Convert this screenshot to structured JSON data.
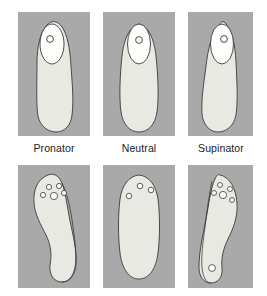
{
  "figure": {
    "panel_bg": "#a9a9a9",
    "shape_fill": "#e9e9e4",
    "shape_stroke": "#3a3a3a",
    "hole_fill": "#ffffff",
    "caption_color": "#1b1b1b"
  },
  "columns": [
    {
      "key": "pronator",
      "caption": "Pronator",
      "top_panel": {
        "name": "rear-view-foot-pronator",
        "description": "Posterior view of foot angled inward (everted heel)",
        "ankle_marker_count": 1
      },
      "bottom_panel": {
        "name": "insole-pronator",
        "description": "Medial-post insole with inner contour line",
        "forefoot_holes": 5,
        "heel_holes": 0,
        "has_inner_contour": true
      }
    },
    {
      "key": "neutral",
      "caption": "Neutral",
      "top_panel": {
        "name": "rear-view-foot-neutral",
        "description": "Posterior view of foot with vertical heel alignment",
        "ankle_marker_count": 1
      },
      "bottom_panel": {
        "name": "insole-neutral",
        "description": "Flat neutral insole",
        "forefoot_holes": 3,
        "heel_holes": 0,
        "has_inner_contour": false
      }
    },
    {
      "key": "supinator",
      "caption": "Supinator",
      "top_panel": {
        "name": "rear-view-foot-supinator",
        "description": "Posterior view of foot angled outward (inverted heel)",
        "ankle_marker_count": 1
      },
      "bottom_panel": {
        "name": "insole-supinator",
        "description": "Lateral-post insole with inner contour line",
        "forefoot_holes": 5,
        "heel_holes": 1,
        "has_inner_contour": true
      }
    }
  ]
}
